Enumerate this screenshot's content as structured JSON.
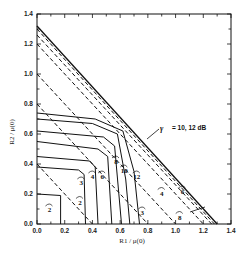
{
  "chart_data": {
    "type": "line",
    "title": "",
    "xlabel": "R1 / μ(0)",
    "ylabel": "R2 / μ(0)",
    "xlim": [
      0,
      1.4
    ],
    "ylim": [
      0,
      1.4
    ],
    "grid": false,
    "x_ticks": [
      "0.0",
      "0.2",
      "0.4",
      "0.6",
      "0.8",
      "1.0",
      "1.2",
      "1.4"
    ],
    "y_ticks": [
      "0.0",
      "0.2",
      "0.4",
      "0.6",
      "0.8",
      "1.0",
      "1.2",
      "1.4"
    ],
    "annotation": {
      "symbol": "γ",
      "text": "= 10, 12 dB"
    },
    "series": [
      {
        "name": "solid γ=2",
        "style": "solid",
        "label": "2",
        "points": [
          [
            0,
            0.2
          ],
          [
            0.17,
            0.19
          ],
          [
            0.17,
            0
          ]
        ]
      },
      {
        "name": "solid γ=3",
        "style": "solid",
        "label": "3",
        "points": [
          [
            0,
            0.38
          ],
          [
            0.3,
            0.36
          ],
          [
            0.34,
            0.33
          ],
          [
            0.35,
            0
          ]
        ]
      },
      {
        "name": "solid γ=4",
        "style": "solid",
        "label": "4",
        "points": [
          [
            0,
            0.45
          ],
          [
            0.38,
            0.42
          ],
          [
            0.42,
            0.38
          ],
          [
            0.44,
            0
          ]
        ]
      },
      {
        "name": "solid γ=6",
        "style": "solid",
        "label": "6",
        "points": [
          [
            0,
            0.55
          ],
          [
            0.44,
            0.5
          ],
          [
            0.51,
            0.45
          ],
          [
            0.54,
            0
          ]
        ]
      },
      {
        "name": "solid γ=8",
        "style": "solid",
        "label": "8",
        "points": [
          [
            0,
            0.62
          ],
          [
            0.48,
            0.58
          ],
          [
            0.56,
            0.52
          ],
          [
            0.61,
            0
          ]
        ]
      },
      {
        "name": "solid γ=10",
        "style": "solid",
        "label": "10",
        "points": [
          [
            0,
            0.7
          ],
          [
            0.4,
            0.67
          ],
          [
            0.58,
            0.6
          ],
          [
            0.64,
            0.3
          ],
          [
            0.67,
            0
          ]
        ]
      },
      {
        "name": "solid γ=12",
        "style": "solid",
        "label": "12",
        "points": [
          [
            0,
            0.74
          ],
          [
            0.42,
            0.7
          ],
          [
            0.62,
            0.62
          ],
          [
            0.7,
            0.35
          ],
          [
            0.74,
            0
          ]
        ]
      },
      {
        "name": "dashed γ=2",
        "style": "dashed",
        "label": "2",
        "points": [
          [
            0,
            0.4
          ],
          [
            0.4,
            0
          ]
        ]
      },
      {
        "name": "dashed γ=3",
        "style": "dashed",
        "label": "3",
        "points": [
          [
            0,
            0.8
          ],
          [
            0.8,
            0
          ]
        ]
      },
      {
        "name": "dashed γ=4",
        "style": "dashed",
        "label": "4",
        "points": [
          [
            0,
            1.0
          ],
          [
            1.0,
            0
          ]
        ]
      },
      {
        "name": "dashed γ=6",
        "style": "dashed",
        "label": "6",
        "points": [
          [
            0,
            1.2
          ],
          [
            1.2,
            0
          ]
        ]
      },
      {
        "name": "dashed γ=8",
        "style": "dashed",
        "label": "8",
        "points": [
          [
            0,
            1.26
          ],
          [
            1.26,
            0
          ]
        ]
      },
      {
        "name": "dashed γ=10,12",
        "style": "dashed",
        "label": "",
        "points": [
          [
            0,
            1.3
          ],
          [
            1.28,
            0
          ]
        ]
      },
      {
        "name": "solid outer γ=10,12",
        "style": "solid",
        "label": "",
        "points": [
          [
            0,
            1.32
          ],
          [
            1.3,
            0
          ]
        ]
      }
    ]
  },
  "labels": {
    "x_axis_title": "R1 / μ(0)",
    "y_axis_title": "R2 / μ(0)",
    "gamma_symbol": "γ",
    "gamma_text": "= 10, 12 dB"
  }
}
